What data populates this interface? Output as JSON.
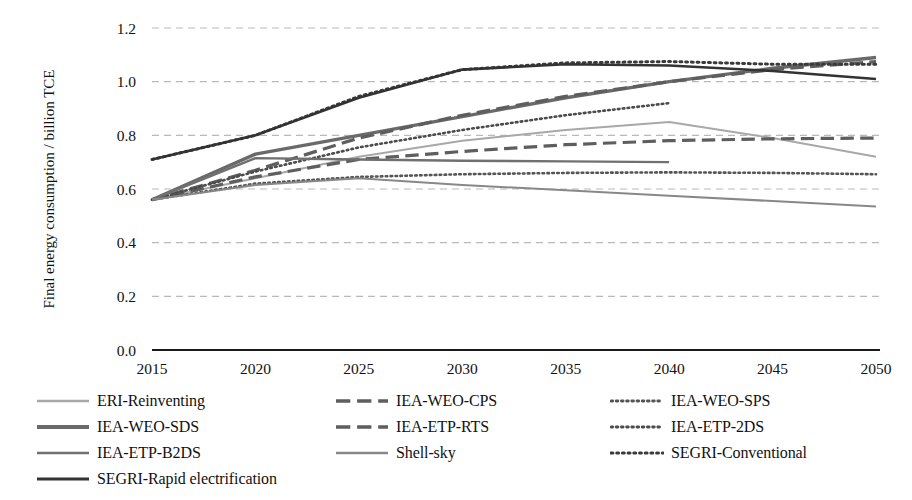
{
  "chart_data": {
    "type": "line",
    "title": "",
    "xlabel": "",
    "ylabel": "Final energy consumption / billion TCE",
    "categories": [
      "2015",
      "2020",
      "2025",
      "2030",
      "2035",
      "2040",
      "2045",
      "2050"
    ],
    "x": [
      2015,
      2020,
      2025,
      2030,
      2035,
      2040,
      2045,
      2050
    ],
    "ylim": [
      0.0,
      1.2
    ],
    "yticks": [
      "0.0",
      "0.2",
      "0.4",
      "0.6",
      "0.8",
      "1.0",
      "1.2"
    ],
    "ytick_values": [
      0.0,
      0.2,
      0.4,
      0.6,
      0.8,
      1.0,
      1.2
    ],
    "grid": "horizontal-dashed",
    "legend_position": "bottom",
    "series": [
      {
        "name": "ERI-Reinventing",
        "style": "solid",
        "color": "#a8a8a8",
        "width": 2.0,
        "x": [
          2015,
          2020,
          2025,
          2030,
          2035,
          2040,
          2045,
          2050
        ],
        "values": [
          0.56,
          0.64,
          0.72,
          0.78,
          0.82,
          0.85,
          0.79,
          0.72
        ]
      },
      {
        "name": "IEA-WEO-CPS",
        "style": "dashed",
        "color": "#5e5e5e",
        "width": 3.2,
        "x": [
          2015,
          2020,
          2025,
          2030,
          2035,
          2040,
          2045,
          2050
        ],
        "values": [
          0.56,
          0.645,
          0.71,
          0.74,
          0.765,
          0.78,
          0.787,
          0.79
        ]
      },
      {
        "name": "IEA-WEO-SPS",
        "style": "dotted",
        "color": "#555555",
        "width": 2.6,
        "x": [
          2015,
          2020,
          2025,
          2030,
          2035,
          2040,
          2045,
          2050
        ],
        "values": [
          0.56,
          0.62,
          0.645,
          0.655,
          0.66,
          0.662,
          0.66,
          0.655
        ]
      },
      {
        "name": "IEA-WEO-SDS",
        "style": "solid",
        "color": "#6a6a6a",
        "width": 3.4,
        "x": [
          2015,
          2020,
          2025,
          2030,
          2035,
          2040,
          2045,
          2050
        ],
        "values": [
          0.56,
          0.73,
          0.8,
          0.87,
          0.94,
          1.0,
          1.05,
          1.09
        ]
      },
      {
        "name": "IEA-ETP-RTS",
        "style": "dashed",
        "color": "#5e5e5e",
        "width": 3.2,
        "x": [
          2015,
          2020,
          2025,
          2030,
          2035,
          2040,
          2045,
          2050
        ],
        "values": [
          0.56,
          0.67,
          0.79,
          0.875,
          0.945,
          1.0,
          1.045,
          1.075
        ]
      },
      {
        "name": "IEA-ETP-2DS",
        "style": "dotted",
        "color": "#4b4b4b",
        "width": 2.6,
        "x": [
          2015,
          2020,
          2025,
          2030,
          2035,
          2040
        ],
        "values": [
          0.56,
          0.665,
          0.755,
          0.82,
          0.875,
          0.92
        ]
      },
      {
        "name": "IEA-ETP-B2DS",
        "style": "solid",
        "color": "#707070",
        "width": 2.4,
        "x": [
          2015,
          2020,
          2025,
          2030,
          2035,
          2040
        ],
        "values": [
          0.56,
          0.715,
          0.71,
          0.705,
          0.703,
          0.7
        ]
      },
      {
        "name": "Shell-sky",
        "style": "solid",
        "color": "#888888",
        "width": 2.0,
        "x": [
          2015,
          2020,
          2025,
          2030,
          2035,
          2040,
          2045,
          2050
        ],
        "values": [
          0.56,
          0.615,
          0.64,
          0.615,
          0.595,
          0.575,
          0.555,
          0.535
        ]
      },
      {
        "name": "SEGRI-Conventional",
        "style": "dotted",
        "color": "#3a3a3a",
        "width": 3.0,
        "x": [
          2015,
          2020,
          2025,
          2030,
          2035,
          2040,
          2045,
          2050
        ],
        "values": [
          0.71,
          0.8,
          0.945,
          1.045,
          1.07,
          1.075,
          1.065,
          1.065
        ]
      },
      {
        "name": "SEGRI-Rapid electrification",
        "style": "solid",
        "color": "#333333",
        "width": 2.6,
        "x": [
          2015,
          2020,
          2025,
          2030,
          2035,
          2040,
          2045,
          2050
        ],
        "values": [
          0.71,
          0.8,
          0.94,
          1.045,
          1.065,
          1.06,
          1.04,
          1.01
        ]
      }
    ]
  },
  "legend": {
    "rows": [
      [
        {
          "label": "ERI-Reinventing",
          "style": "solid",
          "color": "#a8a8a8",
          "width": 2.4
        },
        {
          "label": "IEA-WEO-CPS",
          "style": "dashed",
          "color": "#5e5e5e",
          "width": 3.4
        },
        {
          "label": "IEA-WEO-SPS",
          "style": "dotted",
          "color": "#555555",
          "width": 2.8
        }
      ],
      [
        {
          "label": "IEA-WEO-SDS",
          "style": "solid",
          "color": "#6a6a6a",
          "width": 4.0
        },
        {
          "label": "IEA-ETP-RTS",
          "style": "dashed",
          "color": "#5e5e5e",
          "width": 3.4
        },
        {
          "label": "IEA-ETP-2DS",
          "style": "dotted",
          "color": "#4b4b4b",
          "width": 2.8
        }
      ],
      [
        {
          "label": "IEA-ETP-B2DS",
          "style": "solid",
          "color": "#707070",
          "width": 2.6
        },
        {
          "label": "Shell-sky",
          "style": "solid",
          "color": "#888888",
          "width": 2.6
        },
        {
          "label": "SEGRI-Conventional",
          "style": "dotted",
          "color": "#3a3a3a",
          "width": 3.0
        }
      ],
      [
        {
          "label": "SEGRI-Rapid electrification",
          "style": "solid",
          "color": "#333333",
          "width": 3.0
        }
      ]
    ]
  },
  "colors": {
    "axis": "#1a1a1a",
    "grid": "#b9b9b9",
    "text": "#111111",
    "background": "#ffffff"
  }
}
